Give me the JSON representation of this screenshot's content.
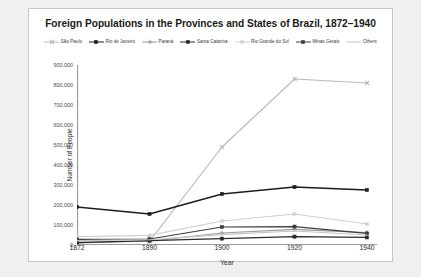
{
  "chart_data": {
    "type": "line",
    "title": "Foreign Populations in the Provinces and States of Brazil, 1872–1940",
    "xlabel": "Year",
    "ylabel": "Number of People",
    "x": [
      1872,
      1890,
      1900,
      1920,
      1940
    ],
    "xtick_labels": [
      "1872",
      "1890",
      "1900",
      "1920",
      "1940"
    ],
    "ylim": [
      0,
      900000
    ],
    "ytick_values": [
      0,
      100000,
      200000,
      300000,
      400000,
      500000,
      600000,
      700000,
      800000,
      900000
    ],
    "ytick_labels": [
      "0",
      "100,000",
      "200,000",
      "300,000",
      "400,000",
      "500,000",
      "600,000",
      "700,000",
      "800,000",
      "900,000"
    ],
    "grid": false,
    "legend_position": "top",
    "series": [
      {
        "name": "São Paulo",
        "color": "#b9b9b9",
        "marker": "x",
        "values": [
          15000,
          18000,
          490000,
          830000,
          810000
        ]
      },
      {
        "name": "Rio de Janeiro",
        "color": "#1c1c1c",
        "marker": "square",
        "values": [
          190000,
          155000,
          255000,
          290000,
          275000
        ]
      },
      {
        "name": "Paraná",
        "color": "#9a9a9a",
        "marker": "plus",
        "values": [
          10000,
          20000,
          60000,
          78000,
          62000
        ]
      },
      {
        "name": "Santa Catarina",
        "color": "#2a2a2a",
        "marker": "square",
        "values": [
          12000,
          22000,
          32000,
          42000,
          38000
        ]
      },
      {
        "name": "Rio Grande do Sul",
        "color": "#cfcfcf",
        "marker": "star",
        "values": [
          42000,
          48000,
          120000,
          155000,
          105000
        ]
      },
      {
        "name": "Minas Gerais",
        "color": "#3d3d3d",
        "marker": "square",
        "values": [
          28000,
          30000,
          90000,
          92000,
          58000
        ]
      },
      {
        "name": "Others",
        "color": "#c4c4c4",
        "marker": "none",
        "values": [
          22000,
          26000,
          52000,
          70000,
          50000
        ]
      }
    ]
  }
}
